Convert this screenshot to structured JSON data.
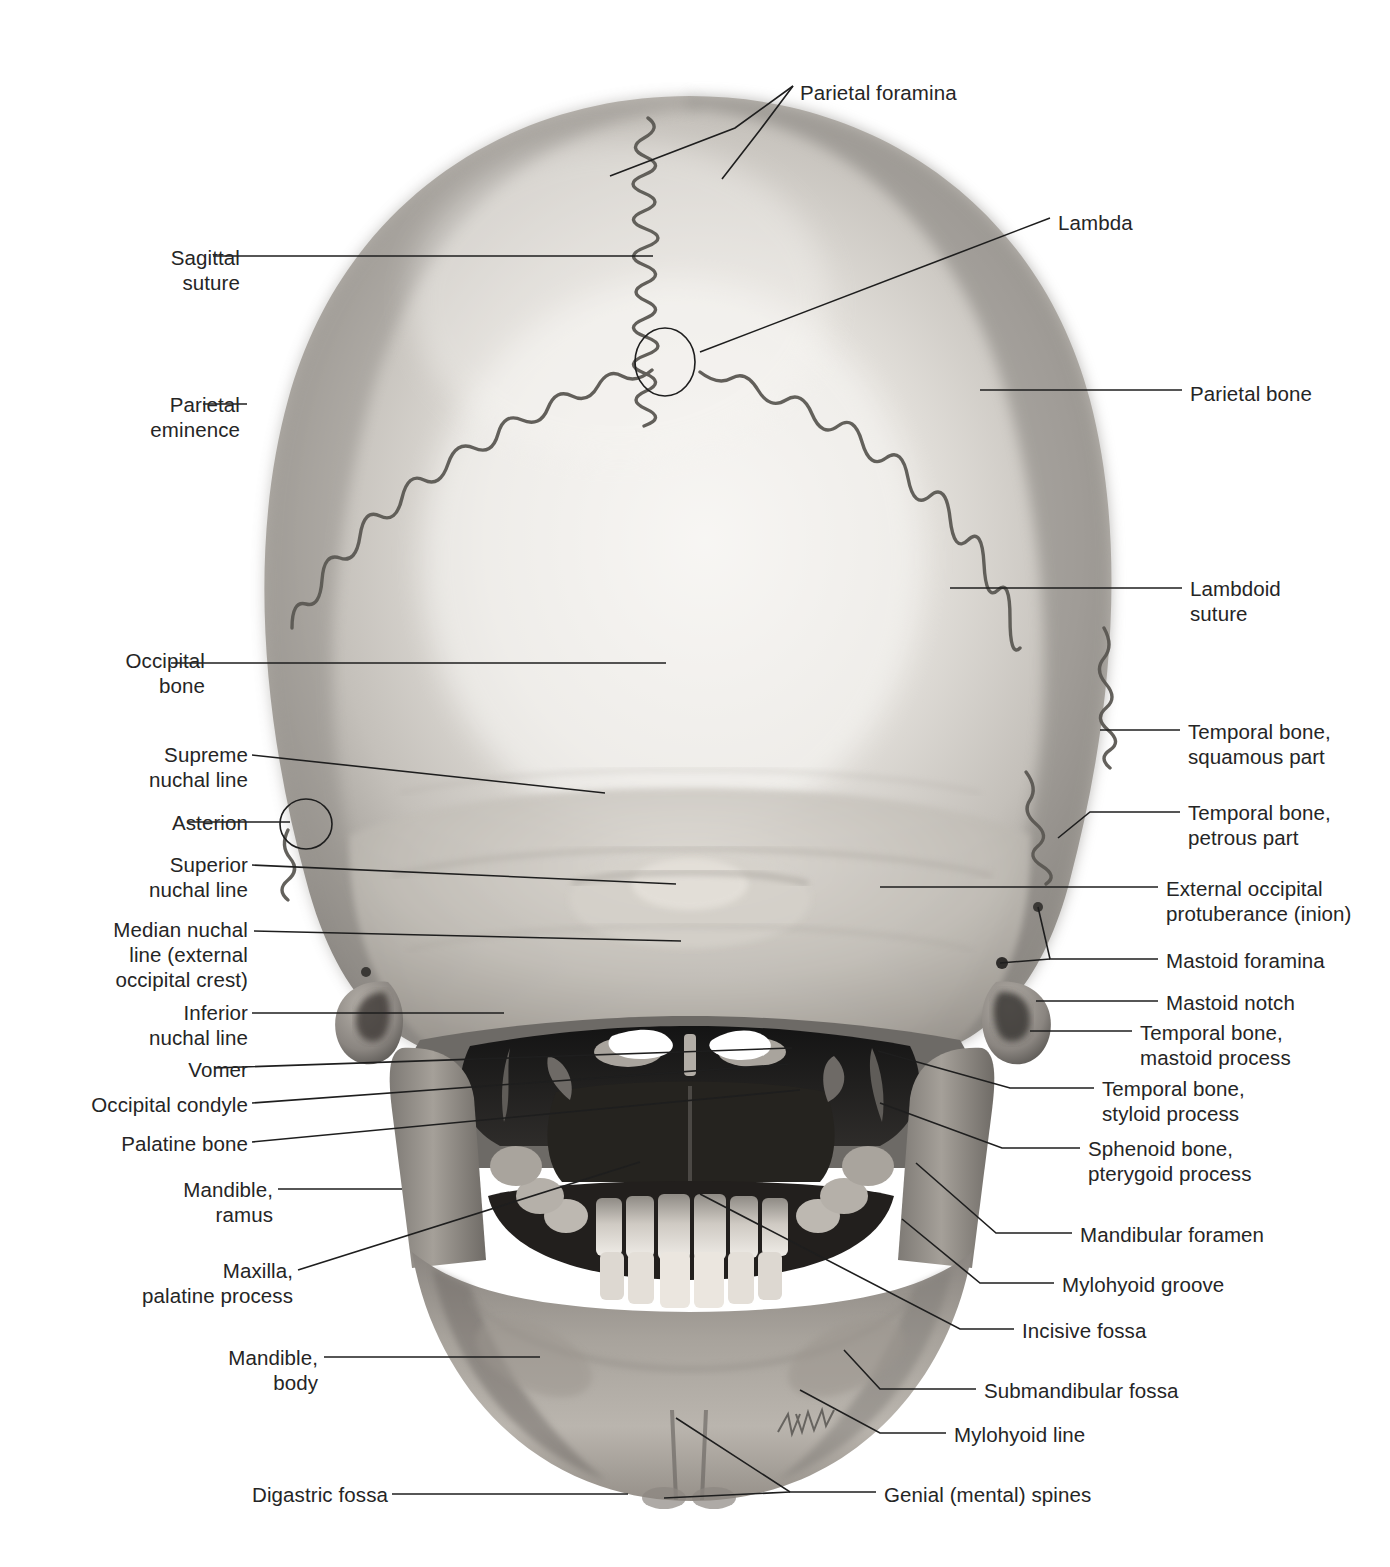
{
  "figure": {
    "artist_signature": "K. Wesker",
    "caption": ""
  },
  "colors": {
    "background": "#ffffff",
    "text": "#252525",
    "leader_line": "#1e1e1e",
    "bone_light": "#e9e7e3",
    "bone_mid": "#b9b6b1",
    "bone_dark": "#8d8a86",
    "cavity_dark": "#1c1c1c",
    "tooth": "#d8d4ce"
  },
  "labels_left": [
    {
      "id": "sagittal-suture",
      "text": "Sagittal\nsuture",
      "x": 120,
      "y": 245,
      "w": 120,
      "align": "right"
    },
    {
      "id": "parietal-eminence",
      "text": "Parietal\neminence",
      "x": 110,
      "y": 392,
      "w": 130,
      "align": "right"
    },
    {
      "id": "occipital-bone",
      "text": "Occipital\nbone",
      "x": 60,
      "y": 648,
      "w": 145,
      "align": "right"
    },
    {
      "id": "supreme-nuchal-line",
      "text": "Supreme\nnuchal line",
      "x": 78,
      "y": 742,
      "w": 170,
      "align": "right"
    },
    {
      "id": "asterion",
      "text": "Asterion",
      "x": 88,
      "y": 810,
      "w": 160,
      "align": "right"
    },
    {
      "id": "superior-nuchal-line",
      "text": "Superior\nnuchal line",
      "x": 78,
      "y": 852,
      "w": 170,
      "align": "right"
    },
    {
      "id": "median-nuchal-line",
      "text": "Median nuchal\nline (external\noccipital crest)",
      "x": 68,
      "y": 917,
      "w": 180,
      "align": "right"
    },
    {
      "id": "inferior-nuchal-line",
      "text": "Inferior\nnuchal line",
      "x": 78,
      "y": 1000,
      "w": 170,
      "align": "right"
    },
    {
      "id": "vomer",
      "text": "Vomer",
      "x": 98,
      "y": 1057,
      "w": 150,
      "align": "right"
    },
    {
      "id": "occipital-condyle",
      "text": "Occipital condyle",
      "x": 48,
      "y": 1092,
      "w": 200,
      "align": "right"
    },
    {
      "id": "palatine-bone",
      "text": "Palatine bone",
      "x": 68,
      "y": 1131,
      "w": 180,
      "align": "right"
    },
    {
      "id": "mandible-ramus",
      "text": "Mandible,\nramus",
      "x": 108,
      "y": 1177,
      "w": 165,
      "align": "right"
    },
    {
      "id": "maxilla-palatine-process",
      "text": "Maxilla,\npalatine process",
      "x": 78,
      "y": 1258,
      "w": 215,
      "align": "right"
    },
    {
      "id": "mandible-body",
      "text": "Mandible,\nbody",
      "x": 148,
      "y": 1345,
      "w": 170,
      "align": "right"
    },
    {
      "id": "digastric-fossa",
      "text": "Digastric fossa",
      "x": 178,
      "y": 1482,
      "w": 210,
      "align": "right"
    }
  ],
  "labels_right": [
    {
      "id": "parietal-foramina",
      "text": "Parietal foramina",
      "x": 800,
      "y": 80,
      "align": "left"
    },
    {
      "id": "lambda",
      "text": "Lambda",
      "x": 1058,
      "y": 210,
      "align": "left"
    },
    {
      "id": "parietal-bone",
      "text": "Parietal bone",
      "x": 1190,
      "y": 381,
      "align": "left"
    },
    {
      "id": "lambdoid-suture",
      "text": "Lambdoid\nsuture",
      "x": 1190,
      "y": 576,
      "align": "left"
    },
    {
      "id": "temporal-bone-squamous",
      "text": "Temporal bone,\nsquamous part",
      "x": 1188,
      "y": 719,
      "align": "left"
    },
    {
      "id": "temporal-bone-petrous",
      "text": "Temporal bone,\npetrous part",
      "x": 1188,
      "y": 800,
      "align": "left"
    },
    {
      "id": "external-occipital-protuberance",
      "text": "External occipital\nprotuberance (inion)",
      "x": 1166,
      "y": 876,
      "align": "left"
    },
    {
      "id": "mastoid-foramina",
      "text": "Mastoid foramina",
      "x": 1166,
      "y": 948,
      "align": "left"
    },
    {
      "id": "mastoid-notch",
      "text": "Mastoid notch",
      "x": 1166,
      "y": 990,
      "align": "left"
    },
    {
      "id": "temporal-bone-mastoid-process",
      "text": "Temporal bone,\nmastoid process",
      "x": 1140,
      "y": 1020,
      "align": "left"
    },
    {
      "id": "temporal-bone-styloid-process",
      "text": "Temporal bone,\nstyloid process",
      "x": 1102,
      "y": 1076,
      "align": "left"
    },
    {
      "id": "sphenoid-bone-pterygoid-process",
      "text": "Sphenoid bone,\npterygoid process",
      "x": 1088,
      "y": 1136,
      "align": "left"
    },
    {
      "id": "mandibular-foramen",
      "text": "Mandibular foramen",
      "x": 1080,
      "y": 1222,
      "align": "left"
    },
    {
      "id": "mylohyoid-groove",
      "text": "Mylohyoid groove",
      "x": 1062,
      "y": 1272,
      "align": "left"
    },
    {
      "id": "incisive-fossa",
      "text": "Incisive fossa",
      "x": 1022,
      "y": 1318,
      "align": "left"
    },
    {
      "id": "submandibular-fossa",
      "text": "Submandibular fossa",
      "x": 984,
      "y": 1378,
      "align": "left"
    },
    {
      "id": "mylohyoid-line",
      "text": "Mylohyoid line",
      "x": 954,
      "y": 1422,
      "align": "left"
    },
    {
      "id": "genial-mental-spines",
      "text": "Genial (mental) spines",
      "x": 884,
      "y": 1482,
      "align": "left"
    }
  ],
  "markers": [
    {
      "id": "lambda-circle",
      "cx": 665,
      "cy": 362,
      "rx": 30,
      "ry": 34
    },
    {
      "id": "asterion-circle",
      "cx": 306,
      "cy": 824,
      "rx": 26,
      "ry": 25
    }
  ],
  "leaders": [
    {
      "id": "lead-parietal-foramina-a",
      "pts": "793,86 735,128 610,176"
    },
    {
      "id": "lead-parietal-foramina-b",
      "pts": "793,86 760,130 722,179"
    },
    {
      "id": "lead-lambda",
      "pts": "1050,218 700,352"
    },
    {
      "id": "lead-sagittal-suture",
      "pts": "213,256 653,256"
    },
    {
      "id": "lead-parietal-eminence",
      "pts": "203,404 247,404"
    },
    {
      "id": "lead-parietal-bone",
      "pts": "1182,390 980,390"
    },
    {
      "id": "lead-lambdoid-suture",
      "pts": "1182,588 950,588"
    },
    {
      "id": "lead-occipital-bone",
      "pts": "171,663 666,663"
    },
    {
      "id": "lead-temporal-squamous",
      "pts": "1180,730 1100,730"
    },
    {
      "id": "lead-temporal-petrous",
      "pts": "1180,812 1090,812 1058,838"
    },
    {
      "id": "lead-supreme-nuchal",
      "pts": "252,755 605,793"
    },
    {
      "id": "lead-asterion",
      "pts": "188,822 290,822"
    },
    {
      "id": "lead-superior-nuchal",
      "pts": "252,865 676,884"
    },
    {
      "id": "lead-ext-occ-prot",
      "pts": "1158,887 880,887"
    },
    {
      "id": "lead-median-nuchal",
      "pts": "254,931 681,941"
    },
    {
      "id": "lead-mastoid-foramina",
      "pts": "1158,959 1050,959 1038,907"
    },
    {
      "id": "lead-mastoid-foramina-b",
      "pts": "1050,959 1000,963"
    },
    {
      "id": "lead-inferior-nuchal",
      "pts": "252,1013 504,1013"
    },
    {
      "id": "lead-mastoid-notch",
      "pts": "1158,1001 1036,1001"
    },
    {
      "id": "lead-temporal-mastoid",
      "pts": "1132,1031 1030,1031"
    },
    {
      "id": "lead-vomer",
      "pts": "214,1068 680,1052 792,1048"
    },
    {
      "id": "lead-occipital-condyle",
      "pts": "252,1103 790,1064"
    },
    {
      "id": "lead-temporal-styloid",
      "pts": "1094,1088 1010,1088 878,1051"
    },
    {
      "id": "lead-palatine-bone",
      "pts": "252,1142 800,1090"
    },
    {
      "id": "lead-sphenoid-pterygoid",
      "pts": "1080,1148 1002,1148 880,1103"
    },
    {
      "id": "lead-mandible-ramus",
      "pts": "278,1189 402,1189"
    },
    {
      "id": "lead-mandibular-foramen",
      "pts": "1072,1233 996,1233 916,1163"
    },
    {
      "id": "lead-maxilla-palatine",
      "pts": "298,1270 640,1162"
    },
    {
      "id": "lead-mylohyoid-groove",
      "pts": "1054,1283 980,1283 902,1219"
    },
    {
      "id": "lead-incisive-fossa",
      "pts": "1014,1329 960,1329 700,1194"
    },
    {
      "id": "lead-mandible-body",
      "pts": "324,1357 540,1357"
    },
    {
      "id": "lead-submandibular-fossa",
      "pts": "976,1389 880,1389 844,1350"
    },
    {
      "id": "lead-mylohyoid-line",
      "pts": "946,1433 880,1433 800,1390"
    },
    {
      "id": "lead-digastric-fossa",
      "pts": "392,1494 628,1494"
    },
    {
      "id": "lead-genial-spines-a",
      "pts": "876,1492 790,1492 676,1418"
    },
    {
      "id": "lead-genial-spines-b",
      "pts": "790,1492 664,1498"
    }
  ]
}
